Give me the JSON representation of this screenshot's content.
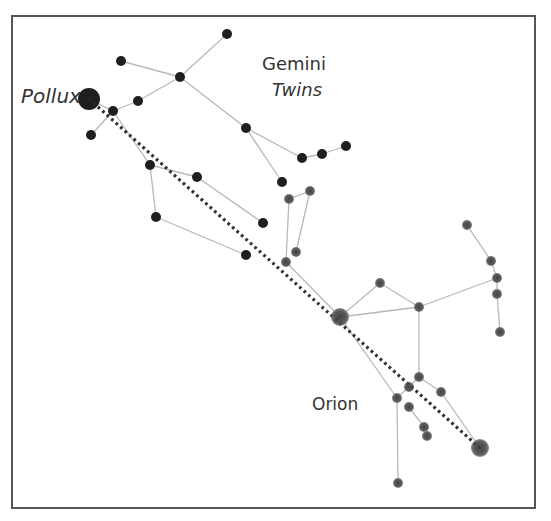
{
  "labels": {
    "pollux": "Pollux",
    "gemini": "Gemini",
    "gemini_sub": "Twins",
    "orion": "Orion"
  },
  "colors": {
    "gemini_star": "#1f1f1f",
    "orion_star": "#555555",
    "line": "#b8b8b8",
    "pointer": "#333333",
    "frame": "#555555"
  },
  "gemini": {
    "stars": [
      {
        "id": "pollux",
        "x": 89,
        "y": 99,
        "r": 11
      },
      {
        "id": "g1",
        "x": 227,
        "y": 34,
        "r": 5
      },
      {
        "id": "g2",
        "x": 121,
        "y": 61,
        "r": 5
      },
      {
        "id": "g3",
        "x": 180,
        "y": 77,
        "r": 5
      },
      {
        "id": "g4",
        "x": 138,
        "y": 101,
        "r": 5
      },
      {
        "id": "g5",
        "x": 113,
        "y": 111,
        "r": 5
      },
      {
        "id": "g6",
        "x": 91,
        "y": 135,
        "r": 5
      },
      {
        "id": "g7",
        "x": 246,
        "y": 128,
        "r": 5
      },
      {
        "id": "g8",
        "x": 302,
        "y": 158,
        "r": 5
      },
      {
        "id": "g9",
        "x": 322,
        "y": 154,
        "r": 5
      },
      {
        "id": "g10",
        "x": 346,
        "y": 146,
        "r": 5
      },
      {
        "id": "g11",
        "x": 282,
        "y": 182,
        "r": 5
      },
      {
        "id": "g12",
        "x": 150,
        "y": 165,
        "r": 5
      },
      {
        "id": "g13",
        "x": 197,
        "y": 177,
        "r": 5
      },
      {
        "id": "g14",
        "x": 156,
        "y": 217,
        "r": 5
      },
      {
        "id": "g15",
        "x": 263,
        "y": 223,
        "r": 5
      },
      {
        "id": "g16",
        "x": 246,
        "y": 255,
        "r": 5
      }
    ],
    "lines": [
      [
        "g1",
        "g3"
      ],
      [
        "g2",
        "g3"
      ],
      [
        "g3",
        "g4"
      ],
      [
        "g4",
        "g5"
      ],
      [
        "g5",
        "pollux"
      ],
      [
        "g5",
        "g6"
      ],
      [
        "g3",
        "g7"
      ],
      [
        "g7",
        "g8"
      ],
      [
        "g8",
        "g9"
      ],
      [
        "g9",
        "g10"
      ],
      [
        "g7",
        "g11"
      ],
      [
        "g5",
        "g12"
      ],
      [
        "g12",
        "g13"
      ],
      [
        "g13",
        "g15"
      ],
      [
        "g12",
        "g14"
      ],
      [
        "g14",
        "g16"
      ]
    ]
  },
  "orion": {
    "stars": [
      {
        "id": "o1",
        "x": 289,
        "y": 199,
        "r": 5
      },
      {
        "id": "o2",
        "x": 310,
        "y": 191,
        "r": 5
      },
      {
        "id": "o3",
        "x": 296,
        "y": 252,
        "r": 5
      },
      {
        "id": "o4",
        "x": 286,
        "y": 262,
        "r": 5
      },
      {
        "id": "betelgeuse",
        "x": 340,
        "y": 317,
        "r": 9
      },
      {
        "id": "o5",
        "x": 380,
        "y": 283,
        "r": 5
      },
      {
        "id": "o6",
        "x": 419,
        "y": 307,
        "r": 5
      },
      {
        "id": "o7",
        "x": 467,
        "y": 225,
        "r": 5
      },
      {
        "id": "o8",
        "x": 491,
        "y": 261,
        "r": 5
      },
      {
        "id": "o9",
        "x": 497,
        "y": 278,
        "r": 5
      },
      {
        "id": "o10",
        "x": 497,
        "y": 294,
        "r": 5
      },
      {
        "id": "o11",
        "x": 500,
        "y": 332,
        "r": 5
      },
      {
        "id": "o12",
        "x": 419,
        "y": 377,
        "r": 5
      },
      {
        "id": "o13",
        "x": 409,
        "y": 387,
        "r": 5
      },
      {
        "id": "o14",
        "x": 441,
        "y": 392,
        "r": 5
      },
      {
        "id": "o15",
        "x": 397,
        "y": 398,
        "r": 5
      },
      {
        "id": "o16",
        "x": 409,
        "y": 407,
        "r": 5
      },
      {
        "id": "o17",
        "x": 424,
        "y": 427,
        "r": 5
      },
      {
        "id": "o18",
        "x": 427,
        "y": 436,
        "r": 5
      },
      {
        "id": "rigel",
        "x": 480,
        "y": 448,
        "r": 9
      },
      {
        "id": "o19",
        "x": 398,
        "y": 483,
        "r": 5
      }
    ],
    "lines": [
      [
        "o1",
        "o2"
      ],
      [
        "o1",
        "o4"
      ],
      [
        "o2",
        "o3"
      ],
      [
        "o4",
        "betelgeuse"
      ],
      [
        "betelgeuse",
        "o5"
      ],
      [
        "o5",
        "o6"
      ],
      [
        "betelgeuse",
        "o6"
      ],
      [
        "o6",
        "o9"
      ],
      [
        "o7",
        "o8"
      ],
      [
        "o8",
        "o9"
      ],
      [
        "o9",
        "o10"
      ],
      [
        "o10",
        "o11"
      ],
      [
        "o6",
        "o12"
      ],
      [
        "o12",
        "o13"
      ],
      [
        "o12",
        "o14"
      ],
      [
        "o14",
        "rigel"
      ],
      [
        "o13",
        "o15"
      ],
      [
        "betelgeuse",
        "o15"
      ],
      [
        "o15",
        "o19"
      ],
      [
        "o16",
        "o17"
      ]
    ]
  },
  "pointer": {
    "from": "pollux",
    "to": "rigel"
  }
}
